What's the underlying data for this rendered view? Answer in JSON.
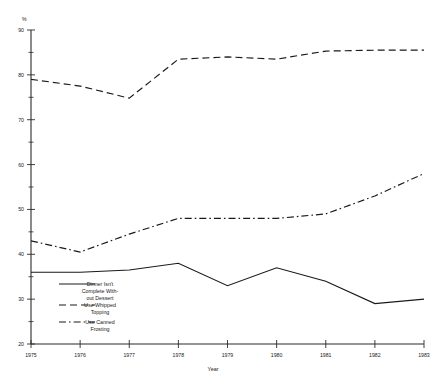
{
  "chart_data": {
    "type": "line",
    "title": "",
    "xlabel": "Year",
    "ylabel": "%",
    "x": [
      1975,
      1976,
      1977,
      1978,
      1979,
      1980,
      1981,
      1982,
      1983
    ],
    "xtick_labels": [
      "1975",
      "1976",
      "1977",
      "1978",
      "1979",
      "1980",
      "1981",
      "1982",
      "1983"
    ],
    "ytick_labels": [
      "20",
      "30",
      "40",
      "50",
      "60",
      "70",
      "80",
      "90"
    ],
    "ytick_values": [
      20,
      30,
      40,
      50,
      60,
      70,
      80,
      90
    ],
    "yminor_values": [
      25,
      35,
      45,
      55,
      65,
      75,
      85
    ],
    "ylim": [
      20,
      90
    ],
    "xlim": [
      1975,
      1983
    ],
    "grid": false,
    "legend_position": "inside-lower-left",
    "series": [
      {
        "name": "Dinner Isn't Complete With-out Dessert",
        "legend_line_1": "Dinner Isn't",
        "legend_line_2": "Complete With-",
        "legend_line_3": "out Dessert",
        "style": "solid",
        "values": [
          36,
          36,
          36.5,
          38,
          33,
          37,
          34,
          29,
          30
        ]
      },
      {
        "name": "Use Whipped Topping",
        "legend_line_1": "Use Whipped",
        "legend_line_2": "Topping",
        "legend_line_3": "",
        "style": "dashed",
        "values": [
          79,
          77.5,
          74.8,
          83.5,
          84,
          83.5,
          85.3,
          85.5,
          85.5
        ]
      },
      {
        "name": "Use Canned Frosting",
        "legend_line_1": "Use Canned",
        "legend_line_2": "Frosting",
        "legend_line_3": "",
        "style": "dashdot",
        "values": [
          43,
          40.5,
          44.5,
          48,
          48,
          48,
          49,
          53,
          58
        ]
      }
    ]
  }
}
